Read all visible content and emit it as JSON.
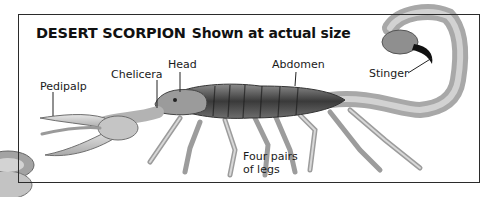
{
  "figure": {
    "title": "DESERT SCORPION",
    "subtitle": "Shown at actual size",
    "labels": [
      {
        "id": "pedipalp",
        "text": "Pedipalp"
      },
      {
        "id": "chelicera",
        "text": "Chelicera"
      },
      {
        "id": "head",
        "text": "Head"
      },
      {
        "id": "abdomen",
        "text": "Abdomen"
      },
      {
        "id": "stinger",
        "text": "Stinger"
      },
      {
        "id": "legs",
        "text": "Four pairs\nof legs"
      }
    ]
  }
}
